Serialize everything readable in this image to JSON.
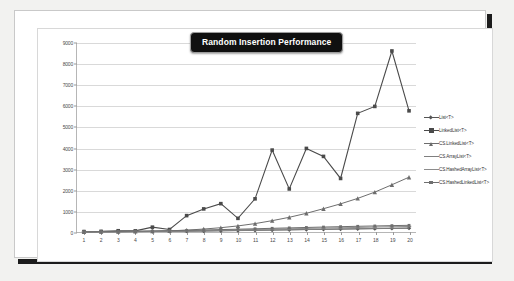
{
  "chart_data": {
    "type": "line",
    "title": "Random Insertion Performance",
    "xlabel": "",
    "ylabel": "",
    "xlim": [
      1,
      20
    ],
    "ylim": [
      0,
      9000
    ],
    "grid": true,
    "legend_position": "right",
    "x": [
      1,
      2,
      3,
      4,
      5,
      6,
      7,
      8,
      9,
      10,
      11,
      12,
      13,
      14,
      15,
      16,
      17,
      18,
      19,
      20
    ],
    "xtick_labels": [
      "1",
      "2",
      "3",
      "4",
      "5",
      "6",
      "7",
      "8",
      "9",
      "10",
      "11",
      "12",
      "13",
      "14",
      "15",
      "16",
      "17",
      "18",
      "19",
      "20"
    ],
    "ytick_labels": [
      "0",
      "1000",
      "2000",
      "3000",
      "4000",
      "5000",
      "6000",
      "7000",
      "8000",
      "9000"
    ],
    "ytick_values": [
      0,
      1000,
      2000,
      3000,
      4000,
      5000,
      6000,
      7000,
      8000,
      9000
    ],
    "series": [
      {
        "name": "List<T>",
        "color": "#555555",
        "marker": "diamond",
        "width": 1.0,
        "values": [
          5,
          8,
          12,
          18,
          25,
          32,
          40,
          50,
          62,
          72,
          85,
          95,
          105,
          118,
          128,
          140,
          150,
          160,
          172,
          182
        ]
      },
      {
        "name": "LinkedList<T>",
        "color": "#4a4a4a",
        "marker": "square",
        "width": 1.1,
        "values": [
          20,
          30,
          60,
          55,
          230,
          120,
          780,
          1100,
          1350,
          650,
          1580,
          3900,
          2050,
          3980,
          3600,
          2550,
          5650,
          5980,
          8620,
          5770
        ]
      },
      {
        "name": "CS.LinkedList<T>",
        "color": "#6d6d6d",
        "marker": "triangle",
        "width": 1.0,
        "values": [
          10,
          15,
          20,
          28,
          40,
          55,
          90,
          140,
          205,
          290,
          400,
          540,
          700,
          890,
          1110,
          1340,
          1600,
          1900,
          2250,
          2610
        ]
      },
      {
        "name": "CS.ArrayList<T>",
        "color": "#7f7f7f",
        "marker": "none",
        "width": 1.0,
        "values": [
          6,
          9,
          13,
          18,
          24,
          30,
          38,
          46,
          56,
          66,
          78,
          90,
          102,
          116,
          128,
          140,
          152,
          164,
          176,
          188
        ]
      },
      {
        "name": "CS.HashedArrayList<T>",
        "color": "#8c8c8c",
        "marker": "dash",
        "width": 1.0,
        "values": [
          8,
          12,
          18,
          26,
          36,
          46,
          58,
          72,
          86,
          102,
          118,
          136,
          152,
          170,
          186,
          202,
          218,
          234,
          250,
          264
        ]
      },
      {
        "name": "CS.HashedLinkedList<T>",
        "color": "#6f6f6f",
        "marker": "square-small",
        "width": 1.0,
        "values": [
          12,
          18,
          26,
          36,
          48,
          62,
          78,
          96,
          114,
          134,
          154,
          176,
          196,
          216,
          236,
          254,
          272,
          288,
          304,
          318
        ]
      }
    ]
  }
}
